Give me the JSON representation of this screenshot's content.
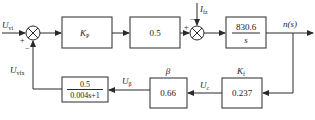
{
  "diagram": {
    "type": "block-diagram",
    "colors": {
      "line": "#2a2a2a",
      "background": "#ffffff"
    },
    "signals": {
      "input": {
        "main": "U",
        "sub": "vi"
      },
      "feedback": {
        "main": "U",
        "sub": "vfx"
      },
      "disturbance": {
        "main": "I",
        "sub": "fz"
      },
      "output": "n(s)",
      "u_beta": {
        "main": "U",
        "sub": "β"
      },
      "u_c": {
        "main": "U",
        "sub": "c"
      }
    },
    "summers": [
      {
        "id": "sum1",
        "signs": {
          "left": "+",
          "bottom": "−"
        }
      },
      {
        "id": "sum2",
        "signs": {
          "left": "+",
          "top": "−"
        }
      }
    ],
    "blocks": {
      "kp": {
        "main": "K",
        "sub": "P"
      },
      "gain": {
        "label": "0.5"
      },
      "integrator": {
        "numerator": "830.6",
        "denominator": "s"
      },
      "kf": {
        "label": "0.237",
        "title_main": "K",
        "title_sub": "f"
      },
      "beta": {
        "label": "0.66",
        "title": "β"
      },
      "filter": {
        "numerator": "0.5",
        "denominator": "0.004s+1"
      }
    }
  }
}
